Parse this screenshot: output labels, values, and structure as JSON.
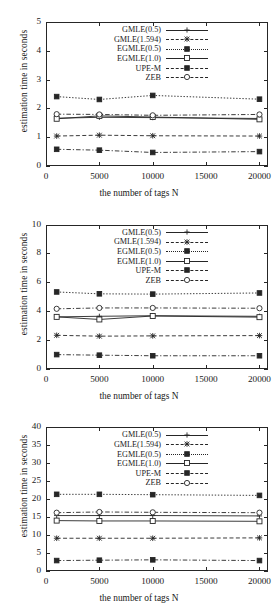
{
  "figure": {
    "axis_title_x": "the number of tags N",
    "axis_title_y": "estimation time in seconds",
    "legend_entries": [
      {
        "label": "GMLE(0.5)",
        "marker": "plus",
        "dash": "solid"
      },
      {
        "label": "GMLE(1.594)",
        "marker": "star",
        "dash": "dashed"
      },
      {
        "label": "EGMLE(0.5)",
        "marker": "filled-square",
        "dash": "dotted"
      },
      {
        "label": "EGMLE(1.0)",
        "marker": "open-square",
        "dash": "solid"
      },
      {
        "label": "UPE-M",
        "marker": "filled-square",
        "dash": "dashdot"
      },
      {
        "label": "ZEB",
        "marker": "open-circle",
        "dash": "dashdot"
      }
    ]
  },
  "chart_data": [
    {
      "type": "line",
      "title": "",
      "xlabel": "the number of tags N",
      "ylabel": "estimation time in seconds",
      "x": [
        1000,
        5000,
        10000,
        20000
      ],
      "xlim": [
        0,
        20800
      ],
      "ylim": [
        0,
        5
      ],
      "xticks": [
        0,
        5000,
        10000,
        15000,
        20000
      ],
      "xticklabels": [
        "0",
        "5000",
        "10000",
        "15000",
        "20000"
      ],
      "yticks": [
        0,
        1,
        2,
        3,
        4,
        5
      ],
      "yticklabels": [
        "0",
        "1",
        "2",
        "3",
        "4",
        "5"
      ],
      "grid": false,
      "legend_position": "upper-center",
      "series": [
        {
          "name": "GMLE(0.5)",
          "marker": "plus",
          "dash": "solid",
          "values": [
            1.66,
            1.69,
            1.68,
            1.65
          ]
        },
        {
          "name": "GMLE(1.594)",
          "marker": "star",
          "dash": "dashed",
          "values": [
            1.04,
            1.07,
            1.05,
            1.04
          ]
        },
        {
          "name": "EGMLE(0.5)",
          "marker": "filled-square",
          "dash": "dotted",
          "values": [
            2.41,
            2.31,
            2.45,
            2.32
          ]
        },
        {
          "name": "EGMLE(1.0)",
          "marker": "open-square",
          "dash": "solid",
          "values": [
            1.64,
            1.74,
            1.7,
            1.62
          ]
        },
        {
          "name": "UPE-M",
          "marker": "filled-square",
          "dash": "dashdot",
          "values": [
            0.58,
            0.55,
            0.47,
            0.5
          ]
        },
        {
          "name": "ZEB",
          "marker": "open-circle",
          "dash": "dashdot",
          "values": [
            1.8,
            1.79,
            1.76,
            1.79
          ]
        }
      ]
    },
    {
      "type": "line",
      "title": "",
      "xlabel": "the number of tags N",
      "ylabel": "estimation time in seconds",
      "x": [
        1000,
        5000,
        10000,
        20000
      ],
      "xlim": [
        0,
        20800
      ],
      "ylim": [
        0,
        10
      ],
      "xticks": [
        0,
        5000,
        10000,
        15000,
        20000
      ],
      "xticklabels": [
        "0",
        "5000",
        "10000",
        "15000",
        "20000"
      ],
      "yticks": [
        0,
        2,
        4,
        6,
        8,
        10
      ],
      "yticklabels": [
        "0",
        "2",
        "4",
        "6",
        "8",
        "10"
      ],
      "grid": false,
      "legend_position": "upper-center",
      "series": [
        {
          "name": "GMLE(0.5)",
          "marker": "plus",
          "dash": "solid",
          "values": [
            3.62,
            3.66,
            3.7,
            3.66
          ]
        },
        {
          "name": "GMLE(1.594)",
          "marker": "star",
          "dash": "dashed",
          "values": [
            2.34,
            2.28,
            2.3,
            2.32
          ]
        },
        {
          "name": "EGMLE(0.5)",
          "marker": "filled-square",
          "dash": "dotted",
          "values": [
            5.35,
            5.22,
            5.2,
            5.28
          ]
        },
        {
          "name": "EGMLE(1.0)",
          "marker": "open-square",
          "dash": "solid",
          "values": [
            3.62,
            3.44,
            3.68,
            3.6
          ]
        },
        {
          "name": "UPE-M",
          "marker": "filled-square",
          "dash": "dashdot",
          "values": [
            1.0,
            0.96,
            0.92,
            0.92
          ]
        },
        {
          "name": "ZEB",
          "marker": "open-circle",
          "dash": "dashdot",
          "values": [
            4.18,
            4.24,
            4.24,
            4.22
          ]
        }
      ]
    },
    {
      "type": "line",
      "title": "",
      "xlabel": "the number of tags N",
      "ylabel": "estimation time in seconds",
      "x": [
        1000,
        5000,
        10000,
        20000
      ],
      "xlim": [
        0,
        20800
      ],
      "ylim": [
        0,
        40
      ],
      "xticks": [
        0,
        5000,
        10000,
        15000,
        20000
      ],
      "xticklabels": [
        "0",
        "5000",
        "10000",
        "15000",
        "20000"
      ],
      "yticks": [
        0,
        5,
        10,
        15,
        20,
        25,
        30,
        35,
        40
      ],
      "yticklabels": [
        "0",
        "5",
        "10",
        "15",
        "20",
        "25",
        "30",
        "35",
        "40"
      ],
      "grid": false,
      "legend_position": "upper-center",
      "series": [
        {
          "name": "GMLE(0.5)",
          "marker": "plus",
          "dash": "solid",
          "values": [
            15.4,
            15.4,
            15.4,
            15.3
          ]
        },
        {
          "name": "GMLE(1.594)",
          "marker": "star",
          "dash": "dashed",
          "values": [
            9.1,
            9.1,
            9.1,
            9.2
          ]
        },
        {
          "name": "EGMLE(0.5)",
          "marker": "filled-square",
          "dash": "dotted",
          "values": [
            21.3,
            21.3,
            21.2,
            21.0
          ]
        },
        {
          "name": "EGMLE(1.0)",
          "marker": "open-square",
          "dash": "solid",
          "values": [
            14.0,
            13.9,
            13.9,
            13.8
          ]
        },
        {
          "name": "UPE-M",
          "marker": "filled-square",
          "dash": "dashdot",
          "values": [
            2.9,
            3.0,
            3.1,
            2.9
          ]
        },
        {
          "name": "ZEB",
          "marker": "open-circle",
          "dash": "dashdot",
          "values": [
            16.2,
            16.4,
            16.3,
            16.2
          ]
        }
      ]
    }
  ]
}
